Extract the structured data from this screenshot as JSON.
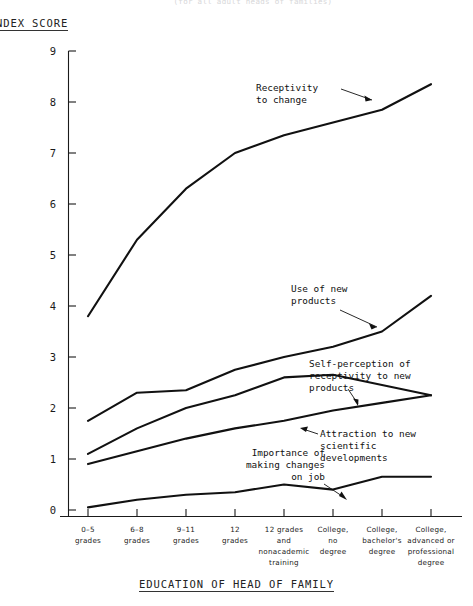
{
  "figure": {
    "cut_off_title": "(for all adult heads of families)",
    "y_axis_title": "NDEX SCORE",
    "x_axis_title": "EDUCATION OF HEAD OF FAMILY"
  },
  "chart_data": {
    "type": "line",
    "title": "",
    "xlabel": "EDUCATION OF HEAD OF FAMILY",
    "ylabel": "NDEX SCORE",
    "ylim": [
      0,
      9
    ],
    "yticks": [
      0,
      1,
      2,
      3,
      4,
      5,
      6,
      7,
      8,
      9
    ],
    "ytick_labels": [
      "0",
      "1",
      "2",
      "3",
      "4",
      "5",
      "6",
      "7",
      "8",
      "9"
    ],
    "grid": false,
    "legend": "inline-annotations",
    "categories": [
      "0-5 grades",
      "6-8 grades",
      "9-11 grades",
      "12 grades",
      "12 grades and nonacademic training",
      "College, no degree",
      "College, bachelor's degree",
      "College, advanced or professional degree"
    ],
    "category_lines": [
      [
        "0–5",
        "grades"
      ],
      [
        "6–8",
        "grades"
      ],
      [
        "9–11",
        "grades"
      ],
      [
        "12",
        "grades"
      ],
      [
        "12 grades",
        "and",
        "nonacademic",
        "training"
      ],
      [
        "College,",
        "no",
        "degree"
      ],
      [
        "College,",
        "bachelor's",
        "degree"
      ],
      [
        "College,",
        "advanced or",
        "professional",
        "degree"
      ]
    ],
    "series": [
      {
        "name": "Receptivity to change",
        "values": [
          3.8,
          5.3,
          6.3,
          7.0,
          7.35,
          7.6,
          7.85,
          8.35
        ]
      },
      {
        "name": "Use of new products",
        "values": [
          1.75,
          2.3,
          2.35,
          2.75,
          3.0,
          3.2,
          3.5,
          4.2
        ]
      },
      {
        "name": "Self-perception of receptivity to new products",
        "values": [
          1.1,
          1.6,
          2.0,
          2.25,
          2.6,
          2.65,
          2.45,
          2.25
        ]
      },
      {
        "name": "Attraction to new scientific developments",
        "values": [
          0.9,
          1.15,
          1.4,
          1.6,
          1.75,
          1.95,
          2.1,
          2.25
        ]
      },
      {
        "name": "Importance of making changes on job",
        "values": [
          0.05,
          0.2,
          0.3,
          0.35,
          0.5,
          0.4,
          0.65,
          0.65
        ]
      }
    ],
    "annotations": [
      {
        "text_lines": [
          "Receptivity",
          "to change"
        ],
        "series": "Receptivity to change"
      },
      {
        "text_lines": [
          "Use of new",
          "products"
        ],
        "series": "Use of new products"
      },
      {
        "text_lines": [
          "Self-perception of",
          "receptivity to new",
          "products"
        ],
        "series": "Self-perception of receptivity to new products"
      },
      {
        "text_lines": [
          "Attraction to new",
          "scientific",
          "developments"
        ],
        "series": "Attraction to new scientific developments"
      },
      {
        "text_lines": [
          "Importance of",
          "making changes",
          "on job"
        ],
        "series": "Importance of making changes on job"
      }
    ]
  }
}
